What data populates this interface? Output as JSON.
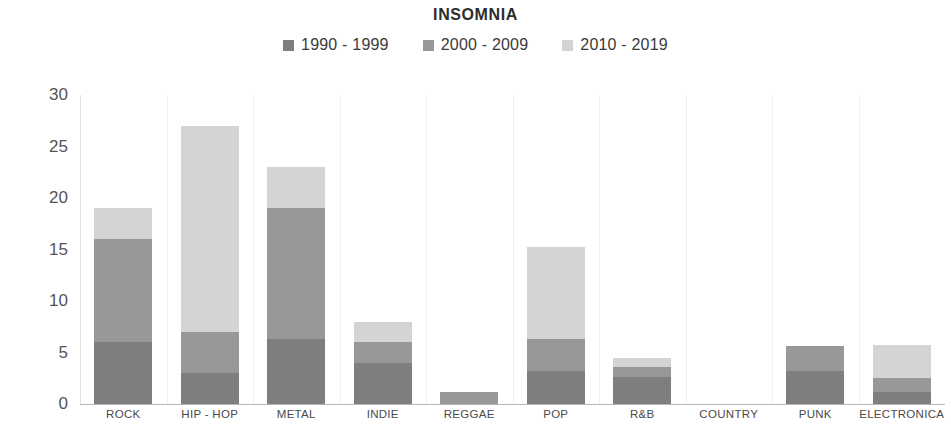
{
  "chart_data": {
    "type": "bar",
    "stacked": true,
    "title": "INSOMNIA",
    "xlabel": "",
    "ylabel": "",
    "ylim": [
      0,
      30
    ],
    "yticks": [
      0,
      5,
      10,
      15,
      20,
      25,
      30
    ],
    "grid": "vertical-category-separators",
    "legend_position": "top-center",
    "categories": [
      "ROCK",
      "HIP - HOP",
      "METAL",
      "INDIE",
      "REGGAE",
      "POP",
      "R&B",
      "COUNTRY",
      "PUNK",
      "ELECTRONICA"
    ],
    "series": [
      {
        "name": "1990 - 1999",
        "color": "#7e7e7e",
        "values": [
          6,
          3,
          6.3,
          4,
          0,
          3.2,
          2.6,
          0,
          3.2,
          1.2
        ]
      },
      {
        "name": "2000 - 2009",
        "color": "#989898",
        "values": [
          10,
          4,
          12.7,
          2,
          1.2,
          3.1,
          1,
          0,
          2.4,
          1.3
        ]
      },
      {
        "name": "2010 - 2019",
        "color": "#d4d4d4",
        "values": [
          3,
          20,
          4,
          2,
          0,
          8.9,
          0.9,
          0,
          0,
          3.2
        ]
      }
    ],
    "totals": [
      19,
      27,
      23,
      8,
      1.2,
      15.2,
      4.5,
      0,
      5.6,
      5.7
    ]
  }
}
